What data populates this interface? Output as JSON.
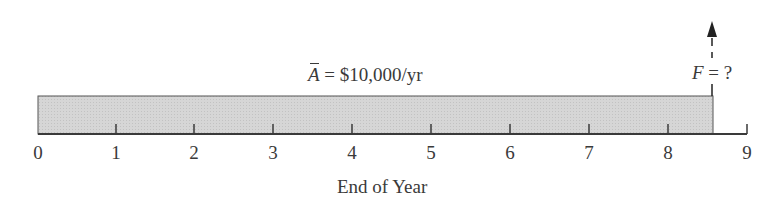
{
  "diagram": {
    "type": "cash-flow-timeline",
    "annuity_label": {
      "symbol": "A",
      "rest": " = $10,000/yr"
    },
    "future_label": {
      "symbol": "F",
      "rest": " = ?"
    },
    "axis_label": "End of Year",
    "ticks": [
      "0",
      "1",
      "2",
      "3",
      "4",
      "5",
      "6",
      "7",
      "8",
      "9"
    ],
    "shaded_region": {
      "from_year": 0,
      "to_year": 8.5,
      "color": "#d4d4d4"
    },
    "arrow_at_year": 8.5,
    "line_color": "#3a3a3a"
  }
}
